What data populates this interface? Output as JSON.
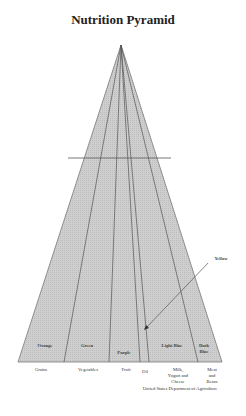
{
  "title": "Nutrition Pyramid",
  "fill_color": "#c9c9c9",
  "line_color": "#555555",
  "bands": [
    {
      "color_label": "Orange",
      "food_group": "Grains"
    },
    {
      "color_label": "Green",
      "food_group": "Vegetables"
    },
    {
      "color_label": "Purple",
      "food_group": "Fruit"
    },
    {
      "color_label": "Yellow",
      "food_group": "Oil"
    },
    {
      "color_label": "Light Blue",
      "food_group": "Milk, Yogurt and Cheese"
    },
    {
      "color_label": "Dark Blue",
      "food_group": "Meat and Beans"
    }
  ],
  "labels": {
    "orange": "Orange",
    "green": "Green",
    "purple": "Purple",
    "light_blue": "Light Blue",
    "dark_blue_1": "Dark",
    "dark_blue_2": "Blue",
    "yellow": "Yellow",
    "grains": "Grains",
    "vegetables": "Vegetables",
    "fruit": "Fruit",
    "oil": "Oil",
    "milk_1": "Milk,",
    "milk_2": "Yogurt and",
    "milk_3": "Cheese",
    "meat_1": "Meat",
    "meat_2": "and",
    "meat_3": "Beans",
    "source": "United States Department of Agriculture"
  }
}
